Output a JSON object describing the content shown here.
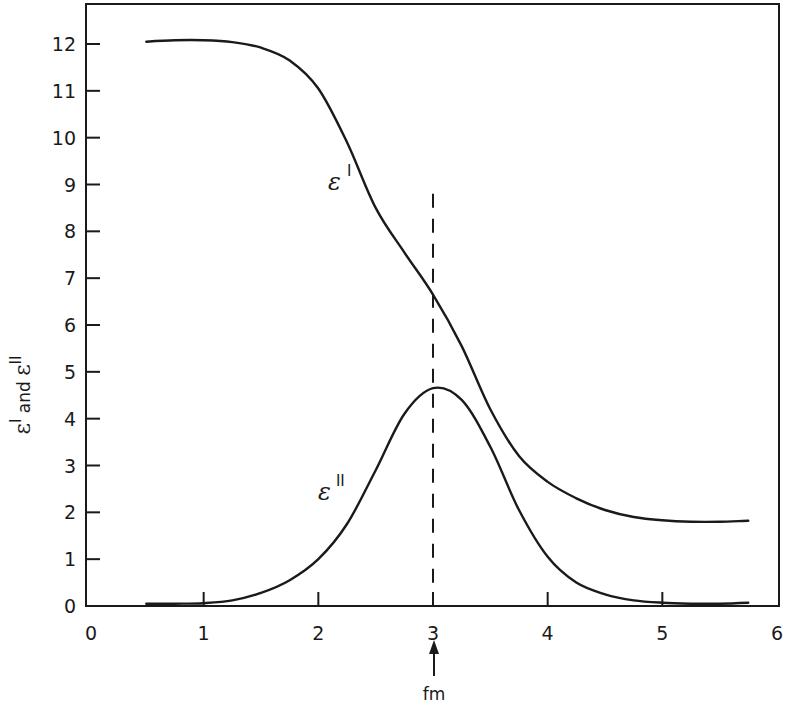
{
  "chart_data": {
    "type": "line",
    "title": "",
    "xlabel": "",
    "ylabel": "ε' and ε''",
    "xlim": [
      0,
      6
    ],
    "ylim": [
      0,
      12.8
    ],
    "grid": false,
    "legend": "none (curves labelled inline)",
    "x_ticks": [
      "0",
      "1",
      "2",
      "3",
      "4",
      "5",
      "6"
    ],
    "y_ticks": [
      "0",
      "1",
      "2",
      "3",
      "4",
      "5",
      "6",
      "7",
      "8",
      "9",
      "10",
      "11",
      "12"
    ],
    "series": [
      {
        "name": "ε'",
        "label": "ε",
        "label_sup": "I",
        "x": [
          0.5,
          0.75,
          1.0,
          1.25,
          1.5,
          1.75,
          2.0,
          2.25,
          2.5,
          2.75,
          3.0,
          3.25,
          3.5,
          3.75,
          4.0,
          4.25,
          4.5,
          4.75,
          5.0,
          5.25,
          5.5,
          5.75
        ],
        "values": [
          12.05,
          12.08,
          12.08,
          12.04,
          11.92,
          11.65,
          11.05,
          9.9,
          8.5,
          7.55,
          6.65,
          5.55,
          4.2,
          3.2,
          2.65,
          2.3,
          2.05,
          1.9,
          1.83,
          1.8,
          1.8,
          1.82
        ]
      },
      {
        "name": "ε''",
        "label": "ε",
        "label_sup": "II",
        "x": [
          0.5,
          0.75,
          1.0,
          1.25,
          1.5,
          1.75,
          2.0,
          2.25,
          2.5,
          2.75,
          3.0,
          3.25,
          3.5,
          3.75,
          4.0,
          4.25,
          4.5,
          4.75,
          5.0,
          5.25,
          5.5,
          5.75
        ],
        "values": [
          0.05,
          0.05,
          0.06,
          0.12,
          0.28,
          0.55,
          1.0,
          1.75,
          2.9,
          4.1,
          4.65,
          4.4,
          3.4,
          2.05,
          1.05,
          0.5,
          0.25,
          0.12,
          0.07,
          0.05,
          0.05,
          0.07
        ]
      }
    ],
    "annotations": [
      {
        "type": "vline",
        "x": 3,
        "style": "dashed",
        "y_from": 0,
        "y_to": 8.8
      },
      {
        "type": "arrow",
        "x": 3,
        "text": "fm",
        "position": "below x-axis, pointing up"
      }
    ]
  },
  "labels": {
    "y_axis_title_main": "ε",
    "y_axis_title_sup1": "I",
    "y_axis_title_and": " and ",
    "y_axis_title_sup2": "II",
    "curve1_main": "ε",
    "curve1_sup": "I",
    "curve2_main": "ε",
    "curve2_sup": "II",
    "fm": "fm"
  }
}
